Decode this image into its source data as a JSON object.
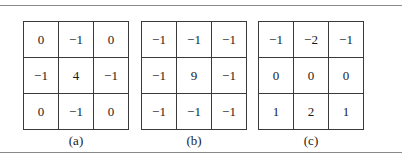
{
  "figure": {
    "panels": [
      {
        "caption": "(a)",
        "rows": [
          [
            "0",
            "−1",
            "0"
          ],
          [
            "−1",
            "4",
            "−1"
          ],
          [
            "0",
            "−1",
            "0"
          ]
        ]
      },
      {
        "caption": "(b)",
        "rows": [
          [
            "−1",
            "−1",
            "−1"
          ],
          [
            "−1",
            "9",
            "−1"
          ],
          [
            "−1",
            "−1",
            "−1"
          ]
        ]
      },
      {
        "caption": "(c)",
        "rows": [
          [
            "−1",
            "−2",
            "−1"
          ],
          [
            "0",
            "0",
            "0"
          ],
          [
            "1",
            "2",
            "1"
          ]
        ]
      }
    ]
  }
}
